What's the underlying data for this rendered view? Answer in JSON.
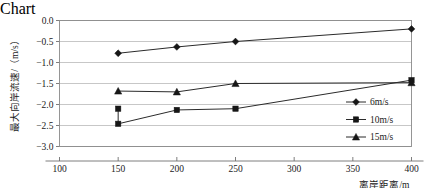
{
  "chart_data": {
    "type": "line",
    "title": "",
    "xlabel": "离岸距离/m",
    "ylabel": "最大向岸流速/（m/s）",
    "xlim": [
      100,
      400
    ],
    "ylim": [
      -3.0,
      0.0
    ],
    "xticks": [
      "100",
      "150",
      "200",
      "250",
      "300",
      "350",
      "400"
    ],
    "yticks": [
      "0.0",
      "-0.5",
      "-1.0",
      "-1.5",
      "-2.0",
      "-2.5",
      "-3.0"
    ],
    "grid": "horizontal",
    "legend_position": "right-inside",
    "x": [
      150,
      200,
      250,
      400
    ],
    "series": [
      {
        "name": "6m/s",
        "marker": "diamond",
        "values": [
          -0.78,
          -0.63,
          -0.5,
          -0.2
        ]
      },
      {
        "name": "10m/s",
        "marker": "square",
        "values": [
          -2.46,
          -2.13,
          -2.1,
          -1.42
        ],
        "extra_points": [
          {
            "x": 150,
            "y": -2.1
          }
        ]
      },
      {
        "name": "15m/s",
        "marker": "triangle",
        "values": [
          -1.68,
          -1.7,
          -1.5,
          -1.48
        ]
      }
    ],
    "colors": {
      "line": "#2b2b2b",
      "marker": "#161616",
      "grid": "#b9b9b9",
      "frame": "#8a8a8a",
      "background": "#ffffff"
    }
  }
}
